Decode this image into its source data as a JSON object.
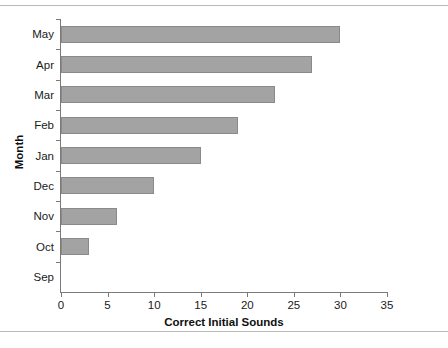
{
  "chart_data": {
    "type": "bar",
    "orientation": "horizontal",
    "title": "",
    "xlabel": "Correct Initial Sounds",
    "ylabel": "Month",
    "categories": [
      "Sep",
      "Oct",
      "Nov",
      "Dec",
      "Jan",
      "Feb",
      "Mar",
      "Apr",
      "May"
    ],
    "values": [
      0,
      3,
      6,
      10,
      15,
      19,
      23,
      27,
      30
    ],
    "xlim": [
      0,
      35
    ],
    "xticks": [
      0,
      5,
      10,
      15,
      20,
      25,
      30,
      35
    ],
    "xtick_labels": [
      "0",
      "5",
      "10",
      "15",
      "20",
      "25",
      "30",
      "35"
    ],
    "grid": false,
    "legend": null,
    "bar_color": "#a3a3a3",
    "bar_edge_color": "#8a8a8a",
    "axis_color": "#7a7a7a",
    "background_color": "#ffffff",
    "series": [
      {
        "name": "Correct Initial Sounds",
        "points": [
          {
            "category": "Sep",
            "value": 0
          },
          {
            "category": "Oct",
            "value": 3
          },
          {
            "category": "Nov",
            "value": 6
          },
          {
            "category": "Dec",
            "value": 10
          },
          {
            "category": "Jan",
            "value": 15
          },
          {
            "category": "Feb",
            "value": 19
          },
          {
            "category": "Mar",
            "value": 23
          },
          {
            "category": "Apr",
            "value": 27
          },
          {
            "category": "May",
            "value": 30
          }
        ]
      }
    ]
  }
}
